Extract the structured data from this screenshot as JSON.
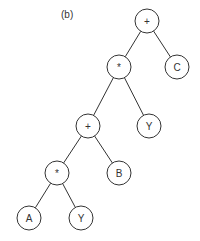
{
  "figure": {
    "label": "(b)",
    "tree": {
      "nodes": [
        {
          "id": "n1",
          "label": "+",
          "x": 147,
          "y": 21
        },
        {
          "id": "n2",
          "label": "*",
          "x": 119,
          "y": 67
        },
        {
          "id": "n3",
          "label": "C",
          "x": 177,
          "y": 67
        },
        {
          "id": "n4",
          "label": "+",
          "x": 88,
          "y": 126
        },
        {
          "id": "n5",
          "label": "Y",
          "x": 149,
          "y": 126
        },
        {
          "id": "n6",
          "label": "*",
          "x": 57,
          "y": 173
        },
        {
          "id": "n7",
          "label": "B",
          "x": 119,
          "y": 173
        },
        {
          "id": "n8",
          "label": "A",
          "x": 29,
          "y": 218
        },
        {
          "id": "n9",
          "label": "Y",
          "x": 81,
          "y": 218
        }
      ],
      "edges": [
        [
          "n1",
          "n2"
        ],
        [
          "n1",
          "n3"
        ],
        [
          "n2",
          "n4"
        ],
        [
          "n2",
          "n5"
        ],
        [
          "n4",
          "n6"
        ],
        [
          "n4",
          "n7"
        ],
        [
          "n6",
          "n8"
        ],
        [
          "n6",
          "n9"
        ]
      ],
      "expression": "((A*Y)+B)*Y+C"
    }
  }
}
